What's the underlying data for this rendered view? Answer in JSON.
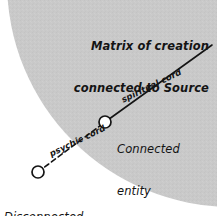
{
  "canvas": {
    "width": 217,
    "height": 216,
    "background_color": "#ffffff"
  },
  "diagram": {
    "type": "conceptual-diagram",
    "title_block": {
      "line1": "Matrix of creation",
      "line2": "connected to Source"
    },
    "shaded_region": {
      "name": "matrix-of-creation-field",
      "fill_color": "#c9c9c9",
      "shape": "large-circle-arc-quadrant"
    },
    "nodes": [
      {
        "id": "connected-entity",
        "label_line1": "Connected",
        "label_line2": "entity",
        "x": 105,
        "y": 122,
        "radius": 6,
        "fill_color": "#ffffff",
        "stroke_color": "#141414",
        "inside_shaded_region": true
      },
      {
        "id": "disconnected-entity",
        "label_line1": "Disconnected",
        "label_line2": "entity",
        "x": 38,
        "y": 172,
        "radius": 6,
        "fill_color": "#ffffff",
        "stroke_color": "#141414",
        "inside_shaded_region": false
      }
    ],
    "cords": [
      {
        "id": "spiritual-cord",
        "label": "spiritual cord",
        "style": "solid",
        "stroke_color": "#141414",
        "from_x": 105,
        "from_y": 122,
        "to_x": 212,
        "to_y": 45
      },
      {
        "id": "psychic-cord",
        "label": "psychic cord",
        "style": "dashed",
        "stroke_color": "#141414",
        "from_x": 38,
        "from_y": 172,
        "to_x": 105,
        "to_y": 122
      }
    ]
  }
}
